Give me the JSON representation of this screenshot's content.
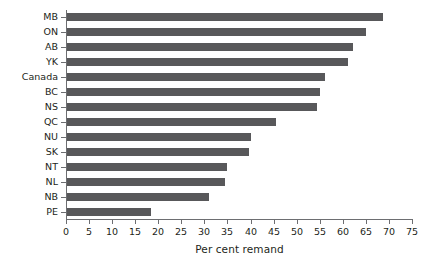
{
  "chart_data": {
    "type": "bar",
    "orientation": "horizontal",
    "title": "",
    "subtitle": "",
    "xlabel": "Per cent remand",
    "ylabel": "",
    "categories": [
      "MB",
      "ON",
      "AB",
      "YK",
      "Canada",
      "BC",
      "NS",
      "QC",
      "NU",
      "SK",
      "NT",
      "NL",
      "NB",
      "PE"
    ],
    "values": [
      68.5,
      64.8,
      62.0,
      60.9,
      55.9,
      54.8,
      54.2,
      45.3,
      39.9,
      39.5,
      34.7,
      34.3,
      30.8,
      18.2
    ],
    "xlim": [
      0,
      75
    ],
    "xticks": [
      0,
      5,
      10,
      15,
      20,
      25,
      30,
      35,
      40,
      45,
      50,
      55,
      60,
      65,
      70,
      75
    ],
    "xtick_labels": [
      "0",
      "5",
      "10",
      "15",
      "20",
      "25",
      "30",
      "35",
      "40",
      "45",
      "50",
      "55",
      "60",
      "65",
      "70",
      "75"
    ],
    "grid": false,
    "legend": null,
    "legend_position": "none",
    "annotations": [],
    "bar_color": "#58585a",
    "axis_color": "#6d6e71",
    "text_color": "#231f20",
    "background_color": "#ffffff"
  }
}
